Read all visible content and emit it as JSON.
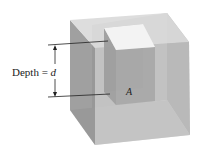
{
  "figure": {
    "depth_label_prefix": "Depth = ",
    "depth_variable": "d",
    "area_label": "A",
    "colors": {
      "background": "#ffffff",
      "cube_top": "#d8d8d8",
      "cube_left": "#9a9a9a",
      "cube_front": "#bdbdbd",
      "cube_right": "#a8a8a8",
      "cube_bottom": "#cfcfcf",
      "column_top": "#f4f4f4",
      "column_side": "#a0a0a0",
      "column_front": "#b5b5b5",
      "lines": "#222222"
    }
  }
}
